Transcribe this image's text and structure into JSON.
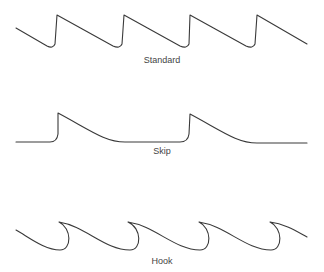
{
  "diagram": {
    "line_color": "#3a3a3a",
    "panels": [
      {
        "id": "standard",
        "label": "Standard",
        "teeth": 4
      },
      {
        "id": "skip",
        "label": "Skip",
        "teeth": 2
      },
      {
        "id": "hook",
        "label": "Hook",
        "teeth": 4
      }
    ]
  }
}
